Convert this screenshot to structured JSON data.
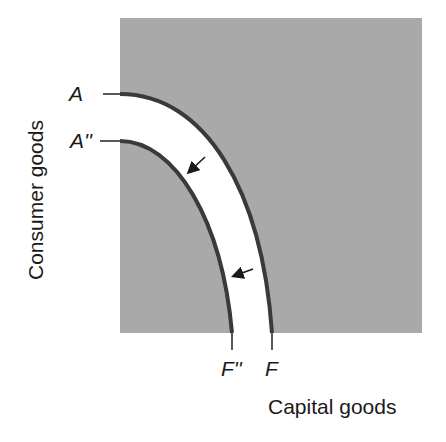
{
  "diagram": {
    "type": "production-possibilities-frontier",
    "y_axis_label": "Consumer goods",
    "x_axis_label": "Capital goods",
    "curves": [
      {
        "id": "outer",
        "start_label": "A",
        "end_label": "F"
      },
      {
        "id": "inner",
        "start_label": "A''",
        "end_label": "F''"
      }
    ],
    "arrows": [
      {
        "direction": "inward",
        "from": "outer",
        "to": "inner"
      },
      {
        "direction": "inward",
        "from": "outer",
        "to": "inner"
      }
    ],
    "colors": {
      "shade": "#a9a9a9",
      "band": "#ffffff",
      "curve": "#3a3a3a",
      "text": "#1a1a1a"
    }
  }
}
